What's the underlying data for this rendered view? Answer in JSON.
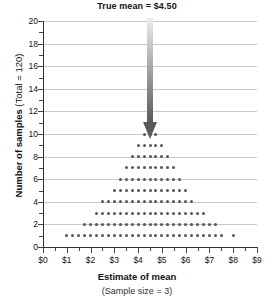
{
  "chart_data": {
    "type": "bar",
    "title": "True mean  =  $4.50",
    "xlabel": "Estimate of mean",
    "xlabel_sub": "(Sample size = 3)",
    "ylabel": "Number of samples ",
    "ylabel_sub": "(Total = 120)",
    "xlim": [
      0,
      9
    ],
    "ylim": [
      0,
      20
    ],
    "grid": true,
    "legend": null,
    "x_tick_labels": [
      "$0",
      "$1",
      "$2",
      "$3",
      "$4",
      "$5",
      "$6",
      "$7",
      "$8",
      "$9"
    ],
    "x_tick_values": [
      0,
      1,
      2,
      3,
      4,
      5,
      6,
      7,
      8,
      9
    ],
    "y_tick_labels": [
      "0",
      "2",
      "4",
      "6",
      "8",
      "10",
      "12",
      "14",
      "16",
      "18",
      "20"
    ],
    "y_tick_values": [
      0,
      2,
      4,
      6,
      8,
      10,
      12,
      14,
      16,
      18,
      20
    ],
    "annotation": {
      "text": "True mean  =  $4.50",
      "value": 4.5,
      "marker": "downward-arrow"
    },
    "bin_width": 0.25,
    "dot_unit": 1,
    "categories": [
      "1.00",
      "1.25",
      "1.50",
      "1.75",
      "2.00",
      "2.25",
      "2.50",
      "2.75",
      "3.00",
      "3.25",
      "3.50",
      "3.75",
      "4.00",
      "4.25",
      "4.50",
      "4.75",
      "5.00",
      "5.25",
      "5.50",
      "5.75",
      "6.00",
      "6.25",
      "6.50",
      "6.75",
      "7.00",
      "7.25",
      "7.50",
      "8.00"
    ],
    "values": [
      1,
      1,
      1,
      2,
      2,
      3,
      4,
      4,
      5,
      6,
      7,
      8,
      9,
      10,
      10,
      10,
      9,
      8,
      7,
      6,
      5,
      4,
      3,
      3,
      2,
      2,
      1,
      1
    ],
    "total_dots": 120
  },
  "colors": {
    "dot": "#555555",
    "grid": "#c9c9c9",
    "axis": "#333333",
    "arrow_top": "#e2e2e2",
    "arrow_bottom": "#5a5a5a",
    "text": "#111111"
  }
}
